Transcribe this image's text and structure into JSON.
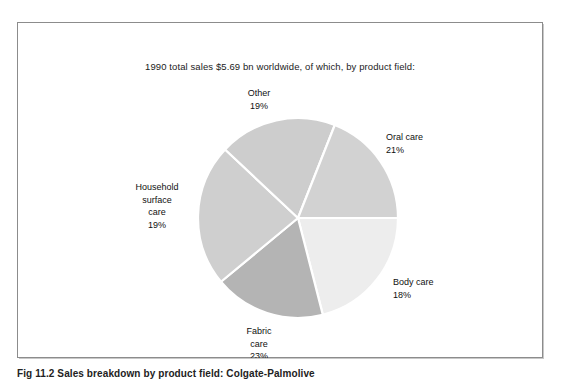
{
  "figure": {
    "caption": "Fig 11.2 Sales breakdown by product field: Colgate-Palmolive",
    "frame_color": "#8c8c8c",
    "background": "#ffffff"
  },
  "chart_data": {
    "type": "pie",
    "title": "1990 total sales $5.69 bn worldwide, of which, by product field:",
    "subtitle": "",
    "xlabel": "",
    "ylabel": "",
    "legend_position": "none",
    "grid": false,
    "units": "percent",
    "total_sales_label": "$5.69 bn",
    "year": "1990",
    "start_angle_deg": 0,
    "direction": "clockwise",
    "categories": [
      "Oral care",
      "Body care",
      "Fabric care",
      "Household surface care",
      "Other"
    ],
    "values": [
      21,
      18,
      23,
      19,
      19
    ],
    "colors": [
      "#ededed",
      "#b4b4b4",
      "#cfcfcf",
      "#cdcdcd",
      "#d2d2d2"
    ],
    "slices": [
      {
        "name": "Oral care",
        "value": 21,
        "value_label": "21%",
        "label_lines": [
          "Oral care",
          "21%"
        ],
        "color": "#ededed",
        "start_deg": 0,
        "end_deg": 75.6
      },
      {
        "name": "Body care",
        "value": 18,
        "value_label": "18%",
        "label_lines": [
          "Body care",
          "18%"
        ],
        "color": "#b4b4b4",
        "start_deg": 284.4,
        "end_deg": 360
      },
      {
        "name": "Fabric care",
        "value": 23,
        "value_label": "23%",
        "label_lines": [
          "Fabric",
          "care",
          "23%"
        ],
        "color": "#cfcfcf",
        "start_deg": 201.6,
        "end_deg": 284.4
      },
      {
        "name": "Household surface care",
        "value": 19,
        "value_label": "19%",
        "label_lines": [
          "Household",
          "surface",
          "care",
          "19%"
        ],
        "color": "#cdcdcd",
        "start_deg": 133.2,
        "end_deg": 201.6
      },
      {
        "name": "Other",
        "value": 19,
        "value_label": "19%",
        "label_lines": [
          "Other",
          "19%"
        ],
        "color": "#d2d2d2",
        "start_deg": 75.6,
        "end_deg": 133.2
      }
    ]
  },
  "labels": {
    "other": {
      "name": "Other",
      "value": "19%"
    },
    "oral": {
      "name": "Oral care",
      "value": "21%"
    },
    "body": {
      "name": "Body care",
      "value": "18%"
    },
    "fabric": {
      "name_line1": "Fabric",
      "name_line2": "care",
      "value": "23%"
    },
    "household": {
      "name_line1": "Household",
      "name_line2": "surface",
      "name_line3": "care",
      "value": "19%"
    }
  }
}
